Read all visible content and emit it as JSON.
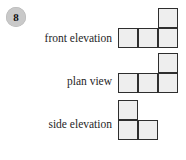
{
  "question": {
    "number": "8",
    "badge_color": "#c9c9c9"
  },
  "style": {
    "cell_fill": "#eeeeee",
    "cell_stroke": "#2e2e2e"
  },
  "views": [
    {
      "id": "front",
      "label": "front elevation",
      "grid": {
        "columns": 3,
        "rows": 2,
        "cells": [
          [
            0,
            0,
            1
          ],
          [
            1,
            1,
            1
          ]
        ]
      }
    },
    {
      "id": "plan",
      "label": "plan view",
      "grid": {
        "columns": 3,
        "rows": 2,
        "cells": [
          [
            0,
            0,
            1
          ],
          [
            1,
            1,
            1
          ]
        ]
      }
    },
    {
      "id": "side",
      "label": "side elevation",
      "grid": {
        "columns": 2,
        "rows": 2,
        "cells": [
          [
            1,
            0
          ],
          [
            1,
            1
          ]
        ]
      }
    }
  ]
}
